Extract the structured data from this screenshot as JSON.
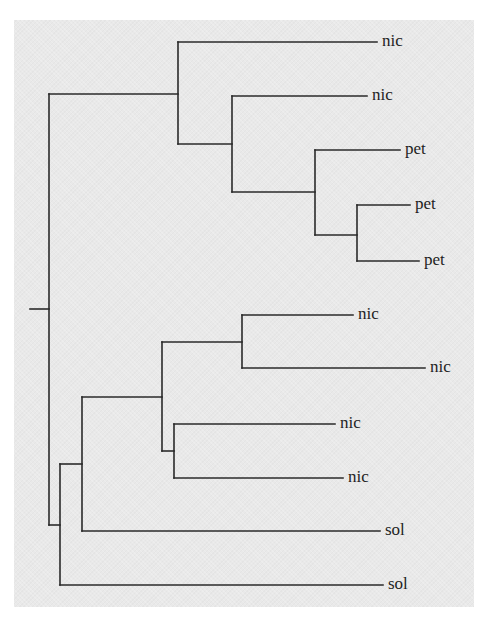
{
  "diagram": {
    "type": "phylogenetic-tree",
    "orientation": "left-to-right",
    "background_color": "#e9e9e9",
    "line_color": "#2a2a2a",
    "root": {
      "x": 30,
      "y": 309
    },
    "leaves": [
      {
        "id": "leaf-1",
        "label": "nic",
        "y": 42,
        "x_start": 178,
        "x_end": 377
      },
      {
        "id": "leaf-2",
        "label": "nic",
        "y": 96,
        "x_start": 232,
        "x_end": 367
      },
      {
        "id": "leaf-3",
        "label": "pet",
        "y": 150,
        "x_start": 315,
        "x_end": 400
      },
      {
        "id": "leaf-4",
        "label": "pet",
        "y": 205,
        "x_start": 357,
        "x_end": 410
      },
      {
        "id": "leaf-5",
        "label": "pet",
        "y": 261,
        "x_start": 357,
        "x_end": 419
      },
      {
        "id": "leaf-6",
        "label": "nic",
        "y": 315,
        "x_start": 242,
        "x_end": 353
      },
      {
        "id": "leaf-7",
        "label": "nic",
        "y": 368,
        "x_start": 242,
        "x_end": 425
      },
      {
        "id": "leaf-8",
        "label": "nic",
        "y": 424,
        "x_start": 174,
        "x_end": 335
      },
      {
        "id": "leaf-9",
        "label": "nic",
        "y": 478,
        "x_start": 174,
        "x_end": 343
      },
      {
        "id": "leaf-10",
        "label": "sol",
        "y": 531,
        "x_start": 82,
        "x_end": 380
      },
      {
        "id": "leaf-11",
        "label": "sol",
        "y": 585,
        "x_start": 60,
        "x_end": 383
      }
    ],
    "internal_nodes": [
      {
        "id": "root",
        "x": 49,
        "y_top": 94,
        "y_bottom": 525,
        "stem_from_x": 30,
        "stem_y": 309
      },
      {
        "id": "node-a",
        "x": 178,
        "y_top": 42,
        "y_bottom": 144,
        "stem_from_x": 49,
        "stem_y": 94
      },
      {
        "id": "node-b",
        "x": 232,
        "y_top": 96,
        "y_bottom": 192,
        "stem_from_x": 178,
        "stem_y": 144
      },
      {
        "id": "node-c",
        "x": 315,
        "y_top": 150,
        "y_bottom": 235,
        "stem_from_x": 232,
        "stem_y": 192
      },
      {
        "id": "node-d",
        "x": 357,
        "y_top": 205,
        "y_bottom": 261,
        "stem_from_x": 315,
        "stem_y": 235
      },
      {
        "id": "node-e",
        "x": 60,
        "y_top": 464,
        "y_bottom": 585,
        "stem_from_x": 49,
        "stem_y": 525
      },
      {
        "id": "node-f",
        "x": 82,
        "y_top": 397,
        "y_bottom": 531,
        "stem_from_x": 60,
        "stem_y": 464
      },
      {
        "id": "node-g",
        "x": 162,
        "y_top": 342,
        "y_bottom": 451,
        "stem_from_x": 82,
        "stem_y": 397
      },
      {
        "id": "node-h",
        "x": 242,
        "y_top": 315,
        "y_bottom": 368,
        "stem_from_x": 162,
        "stem_y": 342
      },
      {
        "id": "node-i",
        "x": 174,
        "y_top": 424,
        "y_bottom": 478,
        "stem_from_x": 162,
        "stem_y": 451
      }
    ]
  }
}
